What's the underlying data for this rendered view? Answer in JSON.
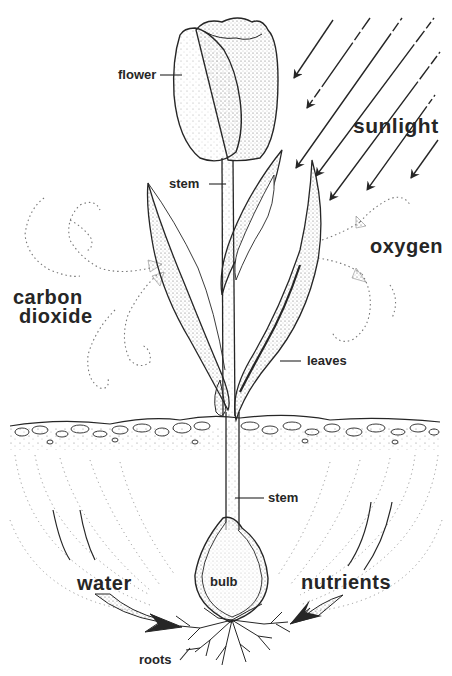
{
  "diagram": {
    "labels": {
      "flower": "flower",
      "stem_upper": "stem",
      "sunlight": "sunlight",
      "oxygen": "oxygen",
      "carbon_dioxide_line1": "carbon",
      "carbon_dioxide_line2": "dioxide",
      "leaves": "leaves",
      "stem_lower": "stem",
      "bulb": "bulb",
      "water": "water",
      "nutrients": "nutrients",
      "roots": "roots"
    },
    "colors": {
      "ink": "#262626",
      "background": "#ffffff",
      "stipple": "#555555"
    }
  }
}
